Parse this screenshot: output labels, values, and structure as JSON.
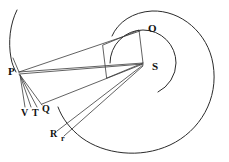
{
  "figure": {
    "background_color": "#ffffff",
    "ink_color": "#2b2b2b",
    "width": 229,
    "height": 162
  },
  "labels": {
    "O": "O",
    "S": "S",
    "P": "P",
    "Q": "Q",
    "T": "T",
    "V": "V",
    "R": "R",
    "r": "r"
  },
  "points": [
    {
      "name": "O",
      "label": "O",
      "x": 148,
      "y": 29,
      "size": "lg"
    },
    {
      "name": "S",
      "label": "S",
      "x": 152,
      "y": 67,
      "size": "lg"
    },
    {
      "name": "P",
      "label": "P",
      "x": 11,
      "y": 72,
      "size": "lg"
    },
    {
      "name": "Q",
      "label": "Q",
      "x": 43,
      "y": 108,
      "size": "md"
    },
    {
      "name": "T",
      "label": "T",
      "x": 33,
      "y": 111,
      "size": "md"
    },
    {
      "name": "V",
      "label": "V",
      "x": 22,
      "y": 111,
      "size": "md"
    },
    {
      "name": "R",
      "label": "R",
      "x": 52,
      "y": 133,
      "size": "md"
    },
    {
      "name": "r",
      "label": "r",
      "x": 62,
      "y": 139,
      "size": "sm"
    }
  ],
  "geometry": {
    "outer_spiral": "large spiral arc sweeping from upper-left around the right and bottom",
    "inner_circle": "small circle centered near S",
    "parallelogram": "quadrilateral with corner at O and corner at S",
    "chords": [
      "P to S",
      "P to O",
      "P to Q",
      "P to T",
      "P to V",
      "S to Q",
      "S to R",
      "S to r",
      "S to P"
    ]
  }
}
